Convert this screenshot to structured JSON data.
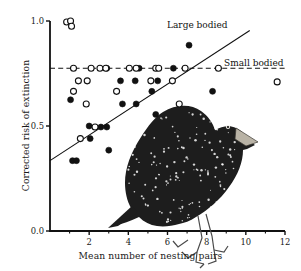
{
  "figure": {
    "kind": "scatter-plot-with-illustration",
    "illustration": "european-starling-bird-drawing"
  },
  "axes": {
    "x": {
      "label": "Mean  number of nesting pairs",
      "ticks": [
        "2",
        "4",
        "6",
        "8",
        "10",
        "12"
      ],
      "tick_values": [
        2,
        4,
        6,
        8,
        10,
        12
      ],
      "minor_tick_values": [
        1,
        3,
        5,
        7,
        9,
        11
      ],
      "range": [
        0,
        12
      ]
    },
    "y": {
      "label": "Corrected risk of extinction",
      "ticks": [
        "0.0",
        "0.5",
        "1.0"
      ],
      "tick_values": [
        0.0,
        0.5,
        1.0
      ],
      "minor_tick_values": [
        0.77
      ],
      "range": [
        0.0,
        1.0
      ]
    }
  },
  "annotations": {
    "large_bodied_label": "Large bodied",
    "small_bodied_label": "Small bodied"
  },
  "colors": {
    "ink": "#111111",
    "axis": "#111111",
    "filled_marker": "#111111",
    "open_marker_stroke": "#111111",
    "background": "#ffffff"
  },
  "chart_data": {
    "type": "scatter",
    "title": "",
    "xlabel": "Mean  number of nesting pairs",
    "ylabel": "Corrected risk of extinction",
    "xlim": [
      0,
      12
    ],
    "ylim": [
      0.0,
      1.0
    ],
    "grid": false,
    "legend_position": "inline-annotations",
    "series": [
      {
        "name": "Large bodied",
        "marker": "filled-circle",
        "points": [
          [
            1.05,
            0.625
          ],
          [
            1.15,
            0.335
          ],
          [
            1.35,
            0.335
          ],
          [
            2.0,
            0.5
          ],
          [
            2.05,
            0.44
          ],
          [
            2.6,
            0.495
          ],
          [
            2.9,
            0.495
          ],
          [
            2.9,
            0.775
          ],
          [
            3.0,
            0.385
          ],
          [
            3.6,
            0.715
          ],
          [
            3.7,
            0.605
          ],
          [
            4.35,
            0.715
          ],
          [
            4.4,
            0.605
          ],
          [
            4.55,
            0.775
          ],
          [
            5.2,
            0.665
          ],
          [
            5.4,
            0.555
          ],
          [
            5.5,
            0.715
          ],
          [
            6.3,
            0.775
          ],
          [
            7.1,
            0.885
          ],
          [
            8.3,
            0.665
          ]
        ]
      },
      {
        "name": "Small bodied",
        "marker": "open-circle",
        "points": [
          [
            0.85,
            0.995
          ],
          [
            1.05,
            1.0
          ],
          [
            1.1,
            0.975
          ],
          [
            1.2,
            0.775
          ],
          [
            1.2,
            0.665
          ],
          [
            1.45,
            0.715
          ],
          [
            1.55,
            0.44
          ],
          [
            1.85,
            0.605
          ],
          [
            1.9,
            0.715
          ],
          [
            2.1,
            0.775
          ],
          [
            2.3,
            0.495
          ],
          [
            2.55,
            0.775
          ],
          [
            2.85,
            0.775
          ],
          [
            3.4,
            0.665
          ],
          [
            4.05,
            0.775
          ],
          [
            4.4,
            0.775
          ],
          [
            5.15,
            0.715
          ],
          [
            5.4,
            0.775
          ],
          [
            5.55,
            0.775
          ],
          [
            6.25,
            0.715
          ],
          [
            6.6,
            0.605
          ],
          [
            6.9,
            0.775
          ],
          [
            8.6,
            0.775
          ],
          [
            11.6,
            0.71
          ]
        ]
      }
    ],
    "lines": [
      {
        "name": "Large bodied",
        "style": "solid",
        "x": [
          0.0,
          10.2
        ],
        "y": [
          0.335,
          0.955
        ]
      },
      {
        "name": "Small bodied",
        "style": "dashed",
        "x": [
          0.0,
          12.0
        ],
        "y": [
          0.775,
          0.775
        ]
      }
    ]
  }
}
